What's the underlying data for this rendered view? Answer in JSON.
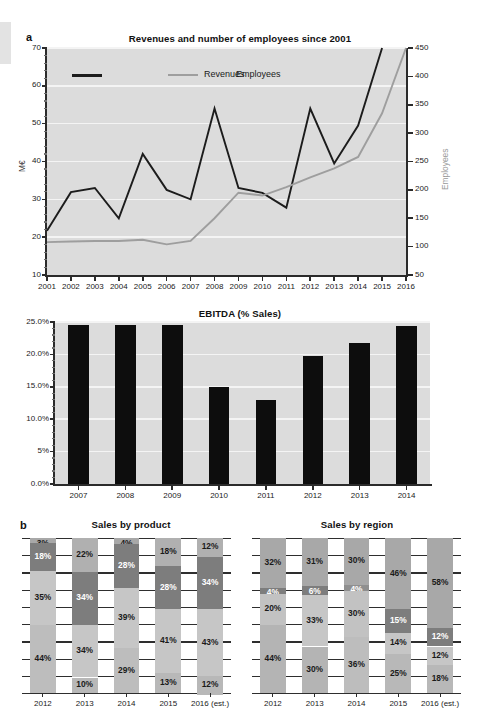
{
  "figure": {
    "panel_a_letter": "a",
    "panel_b_letter": "b"
  },
  "chart_data": [
    {
      "id": "revenues_employees",
      "type": "line",
      "title": "Revenues and number of employees since 2001",
      "xlabel": "",
      "ylabel": "M€",
      "y2label": "Employees",
      "x": [
        "2001",
        "2002",
        "2003",
        "2004",
        "2005",
        "2006",
        "2007",
        "2008",
        "2009",
        "2010",
        "2011",
        "2012",
        "2013",
        "2014",
        "2015",
        "2016"
      ],
      "ylim": [
        10,
        70
      ],
      "yticks": [
        "10",
        "20",
        "30",
        "40",
        "50",
        "60",
        "70"
      ],
      "y2lim": [
        50,
        450
      ],
      "y2ticks": [
        "50",
        "100",
        "150",
        "200",
        "250",
        "300",
        "350",
        "400",
        "450"
      ],
      "grid": true,
      "legend_position": "top-left",
      "series": [
        {
          "name": "Revenues",
          "color": "#1c1c1c",
          "axis": "left",
          "values": [
            21.7,
            31.9,
            33.0,
            25.0,
            42.0,
            32.5,
            30.0,
            54.0,
            33.0,
            31.7,
            27.8,
            54.0,
            39.5,
            49.5,
            70.0,
            null
          ]
        },
        {
          "name": "Employees",
          "color": "#9e9e9e",
          "axis": "right",
          "values": [
            108,
            109,
            110,
            110,
            112,
            104,
            110,
            150,
            195,
            190,
            205,
            222,
            238,
            258,
            335,
            450
          ]
        }
      ]
    },
    {
      "id": "ebitda",
      "type": "bar",
      "title": "EBITDA (% Sales)",
      "xlabel": "",
      "ylabel": "",
      "categories": [
        "2007",
        "2008",
        "2009",
        "2010",
        "2011",
        "2012",
        "2013",
        "2014"
      ],
      "values": [
        24.6,
        24.6,
        24.6,
        15.0,
        13.0,
        19.7,
        21.8,
        24.4
      ],
      "ylim": [
        0,
        25
      ],
      "yticks": [
        "0.0%",
        "5%",
        "10.0%",
        "15.0%",
        "20.0%",
        "25.0%"
      ],
      "bar_color": "#0d0d0d",
      "grid": true
    },
    {
      "id": "sales_by_product",
      "type": "bar",
      "subtype": "stacked-100",
      "title": "Sales by product",
      "categories": [
        "2012",
        "2013",
        "2014",
        "2015",
        "2016 (est.)"
      ],
      "ylim": [
        0,
        100
      ],
      "grid": true,
      "series": [
        {
          "name": "segment-1",
          "color": "#b4b4b4",
          "values": [
            44,
            34,
            29,
            41,
            43
          ]
        },
        {
          "name": "segment-2",
          "color": "#c8c8c8",
          "values": [
            35,
            34,
            39,
            28,
            34
          ]
        },
        {
          "name": "segment-3",
          "color": "#8c8c8c",
          "values": [
            18,
            22,
            28,
            18,
            12
          ]
        },
        {
          "name": "segment-4",
          "color": "#a5a5a5",
          "values": [
            3,
            10,
            4,
            13,
            12
          ]
        }
      ],
      "stacks": [
        {
          "category": "2012",
          "segments": [
            {
              "label": "44%",
              "value": 44,
              "color": "#bdbdbd",
              "text": "#1a1a1a"
            },
            {
              "label": "35%",
              "value": 35,
              "color": "#c6c6c6",
              "text": "#1a1a1a"
            },
            {
              "label": "18%",
              "value": 18,
              "color": "#7d7d7d",
              "text": "#ffffff"
            },
            {
              "label": "3%",
              "value": 3,
              "color": "#a8a8a8",
              "text": "#1a1a1a"
            }
          ]
        },
        {
          "category": "2013",
          "segments": [
            {
              "label": "10%",
              "value": 10,
              "color": "#b8b8b8",
              "text": "#1a1a1a"
            },
            {
              "label": "34%",
              "value": 34,
              "color": "#c6c6c6",
              "text": "#1a1a1a"
            },
            {
              "label": "34%",
              "value": 34,
              "color": "#7d7d7d",
              "text": "#ffffff"
            },
            {
              "label": "22%",
              "value": 22,
              "color": "#b0b0b0",
              "text": "#1a1a1a"
            }
          ]
        },
        {
          "category": "2014",
          "segments": [
            {
              "label": "29%",
              "value": 29,
              "color": "#bdbdbd",
              "text": "#1a1a1a"
            },
            {
              "label": "39%",
              "value": 39,
              "color": "#c6c6c6",
              "text": "#1a1a1a"
            },
            {
              "label": "28%",
              "value": 28,
              "color": "#7d7d7d",
              "text": "#ffffff"
            },
            {
              "label": "4%",
              "value": 4,
              "color": "#a8a8a8",
              "text": "#1a1a1a"
            }
          ]
        },
        {
          "category": "2015",
          "segments": [
            {
              "label": "13%",
              "value": 13,
              "color": "#b8b8b8",
              "text": "#1a1a1a"
            },
            {
              "label": "41%",
              "value": 41,
              "color": "#c6c6c6",
              "text": "#1a1a1a"
            },
            {
              "label": "28%",
              "value": 28,
              "color": "#7d7d7d",
              "text": "#ffffff"
            },
            {
              "label": "18%",
              "value": 18,
              "color": "#b0b0b0",
              "text": "#1a1a1a"
            }
          ]
        },
        {
          "category": "2016 (est.)",
          "segments": [
            {
              "label": "12%",
              "value": 12,
              "color": "#b8b8b8",
              "text": "#1a1a1a"
            },
            {
              "label": "43%",
              "value": 43,
              "color": "#c6c6c6",
              "text": "#1a1a1a"
            },
            {
              "label": "34%",
              "value": 34,
              "color": "#7d7d7d",
              "text": "#ffffff"
            },
            {
              "label": "12%",
              "value": 12,
              "color": "#b0b0b0",
              "text": "#1a1a1a"
            }
          ]
        }
      ]
    },
    {
      "id": "sales_by_region",
      "type": "bar",
      "subtype": "stacked-100",
      "title": "Sales by region",
      "categories": [
        "2012",
        "2013",
        "2014",
        "2015",
        "2016 (est.)"
      ],
      "ylim": [
        0,
        100
      ],
      "grid": true,
      "stacks": [
        {
          "category": "2012",
          "segments": [
            {
              "label": "44%",
              "value": 44,
              "color": "#b4b4b4",
              "text": "#1a1a1a"
            },
            {
              "label": "20%",
              "value": 20,
              "color": "#c2c2c2",
              "text": "#1a1a1a"
            },
            {
              "label": "4%",
              "value": 4,
              "color": "#7d7d7d",
              "text": "#ffffff"
            },
            {
              "label": "32%",
              "value": 32,
              "color": "#a8a8a8",
              "text": "#1a1a1a"
            }
          ]
        },
        {
          "category": "2013",
          "segments": [
            {
              "label": "30%",
              "value": 30,
              "color": "#b4b4b4",
              "text": "#1a1a1a"
            },
            {
              "label": "33%",
              "value": 33,
              "color": "#c6c6c6",
              "text": "#1a1a1a"
            },
            {
              "label": "6%",
              "value": 6,
              "color": "#7d7d7d",
              "text": "#ffffff"
            },
            {
              "label": "31%",
              "value": 31,
              "color": "#a8a8a8",
              "text": "#1a1a1a"
            }
          ]
        },
        {
          "category": "2014",
          "segments": [
            {
              "label": "36%",
              "value": 36,
              "color": "#bdbdbd",
              "text": "#1a1a1a"
            },
            {
              "label": "30%",
              "value": 30,
              "color": "#c2c2c2",
              "text": "#1a1a1a"
            },
            {
              "label": "4%",
              "value": 4,
              "color": "#8f8f8f",
              "text": "#ffffff"
            },
            {
              "label": "30%",
              "value": 30,
              "color": "#a8a8a8",
              "text": "#1a1a1a"
            }
          ]
        },
        {
          "category": "2015",
          "segments": [
            {
              "label": "25%",
              "value": 25,
              "color": "#b8b8b8",
              "text": "#1a1a1a"
            },
            {
              "label": "14%",
              "value": 14,
              "color": "#c6c6c6",
              "text": "#1a1a1a"
            },
            {
              "label": "15%",
              "value": 15,
              "color": "#7d7d7d",
              "text": "#ffffff"
            },
            {
              "label": "46%",
              "value": 46,
              "color": "#a8a8a8",
              "text": "#1a1a1a"
            }
          ]
        },
        {
          "category": "2016 (est.)",
          "segments": [
            {
              "label": "18%",
              "value": 18,
              "color": "#b8b8b8",
              "text": "#1a1a1a"
            },
            {
              "label": "12%",
              "value": 12,
              "color": "#c6c6c6",
              "text": "#1a1a1a"
            },
            {
              "label": "12%",
              "value": 12,
              "color": "#7d7d7d",
              "text": "#ffffff"
            },
            {
              "label": "58%",
              "value": 58,
              "color": "#a8a8a8",
              "text": "#1a1a1a"
            }
          ]
        }
      ]
    }
  ]
}
